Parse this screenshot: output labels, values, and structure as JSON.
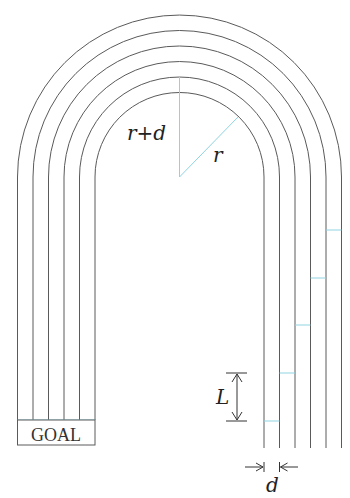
{
  "figure": {
    "type": "running-track-diagram",
    "lanes": 5,
    "lane_lines": 6,
    "labels": {
      "r_plus_d": "r+d",
      "r": "r",
      "L": "L",
      "d": "d",
      "goal": "GOAL"
    },
    "colors": {
      "lane_line": "#5a5a5a",
      "guide_line": "#8fd3e0",
      "text": "#222222"
    }
  }
}
